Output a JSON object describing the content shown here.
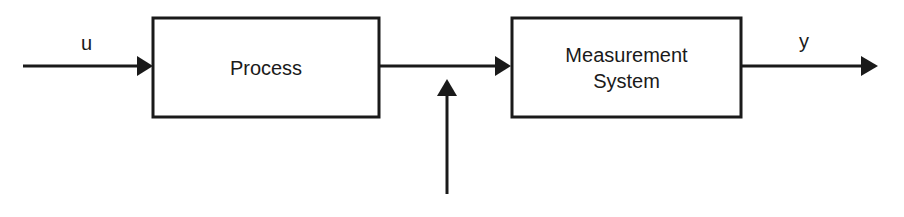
{
  "diagram": {
    "colors": {
      "stroke": "#1a1a1a",
      "background": "#ffffff"
    },
    "blocks": [
      {
        "id": "process",
        "label": "Process"
      },
      {
        "id": "measurement",
        "label": "Measurement\nSystem",
        "line1": "Measurement",
        "line2": "System"
      }
    ],
    "signals": {
      "input": {
        "label": "u"
      },
      "output": {
        "label": "y"
      },
      "disturbance": {
        "label": ""
      }
    },
    "connections": [
      {
        "from": "u",
        "to": "process"
      },
      {
        "from": "process",
        "to": "measurement"
      },
      {
        "from": "disturbance",
        "to": "process-measurement-link"
      },
      {
        "from": "measurement",
        "to": "y"
      }
    ]
  }
}
